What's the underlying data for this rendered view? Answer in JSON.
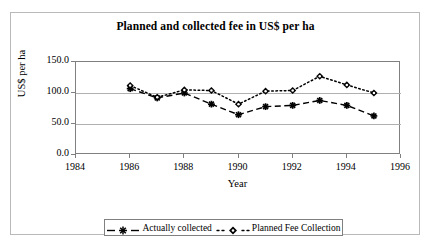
{
  "chart_data": {
    "type": "line",
    "title": "Planned and collected fee in US$ per ha",
    "xlabel": "Year",
    "ylabel": "US$ per ha",
    "x": [
      1986,
      1987,
      1988,
      1989,
      1990,
      1991,
      1992,
      1993,
      1994,
      1995
    ],
    "xlim": [
      1984,
      1996
    ],
    "ylim": [
      0.0,
      150.0
    ],
    "xticks": [
      "1984",
      "1986",
      "1988",
      "1990",
      "1992",
      "1994",
      "1996"
    ],
    "xtick_values": [
      1984,
      1986,
      1988,
      1990,
      1992,
      1994,
      1996
    ],
    "yticks": [
      "0.0",
      "50.0",
      "100.0",
      "150.0"
    ],
    "ytick_values": [
      0.0,
      50.0,
      100.0,
      150.0
    ],
    "grid": "horizontal",
    "legend_position": "bottom",
    "series": [
      {
        "name": "Actually collected",
        "marker": "asterisk",
        "linestyle": "dashed",
        "color": "#000000",
        "values": [
          107,
          92,
          100,
          82,
          65,
          78,
          80,
          88,
          80,
          63
        ]
      },
      {
        "name": "Planned Fee Collection",
        "marker": "diamond",
        "linestyle": "dotted",
        "color": "#000000",
        "values": [
          112,
          93,
          105,
          104,
          82,
          103,
          104,
          127,
          113,
          100
        ]
      }
    ]
  },
  "legend": {
    "entries": [
      {
        "label": "Actually collected"
      },
      {
        "label": "Planned Fee Collection"
      }
    ]
  },
  "colors": {
    "axis": "#808080",
    "grid": "#b0b0b0",
    "frame": "#b9b9b9",
    "text": "#000000",
    "background": "#ffffff"
  }
}
